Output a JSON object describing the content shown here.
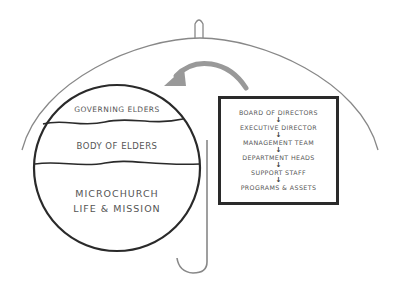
{
  "diagram": {
    "umbrella": {
      "stroke": "#777777",
      "description": "umbrella canopy with handle"
    },
    "arrow": {
      "color": "#999999",
      "direction": "from box to circle"
    },
    "circle": {
      "sections": [
        {
          "label": "GOVERNING ELDERS"
        },
        {
          "label": "BODY OF ELDERS"
        },
        {
          "label_line1": "MICROCHURCH",
          "label_line2": "LIFE & MISSION"
        }
      ]
    },
    "hierarchy_box": {
      "items": [
        "BOARD OF DIRECTORS",
        "EXECUTIVE DIRECTOR",
        "MANAGEMENT TEAM",
        "DEPARTMENT HEADS",
        "SUPPORT STAFF",
        "PROGRAMS & ASSETS"
      ],
      "arrow_glyph": "↓"
    }
  }
}
